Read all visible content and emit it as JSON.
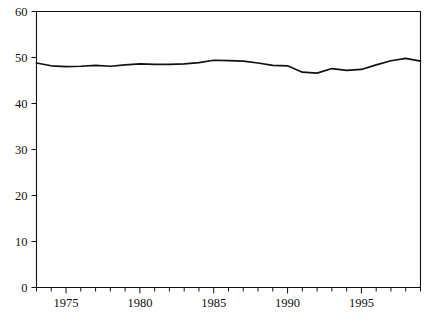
{
  "chart_data": {
    "type": "line",
    "title": "",
    "subtitle": "",
    "xlabel": "",
    "ylabel": "",
    "xlim": [
      1973,
      1999
    ],
    "ylim": [
      0,
      60
    ],
    "grid": false,
    "legend": "none",
    "x_tick_interval": 1,
    "x_label_interval": 5,
    "y_ticks": [
      0,
      10,
      20,
      30,
      40,
      50,
      60
    ],
    "y_tick_labels": [
      "0",
      "10",
      "20",
      "30",
      "40",
      "50",
      "60"
    ],
    "x_ticks": [
      1973,
      1974,
      1975,
      1976,
      1977,
      1978,
      1979,
      1980,
      1981,
      1982,
      1983,
      1984,
      1985,
      1986,
      1987,
      1988,
      1989,
      1990,
      1991,
      1992,
      1993,
      1994,
      1995,
      1996,
      1997,
      1998,
      1999
    ],
    "x_tick_labels": [
      "1975",
      "1980",
      "1985",
      "1990",
      "1995"
    ],
    "x_labelled_ticks": [
      1975,
      1980,
      1985,
      1990,
      1995
    ],
    "series": [
      {
        "name": "series-1",
        "color": "#111111",
        "x": [
          1973,
          1974,
          1975,
          1976,
          1977,
          1978,
          1979,
          1980,
          1981,
          1982,
          1983,
          1984,
          1985,
          1986,
          1987,
          1988,
          1989,
          1990,
          1991,
          1992,
          1993,
          1994,
          1995,
          1996,
          1997,
          1998,
          1999
        ],
        "values": [
          48.8,
          48.2,
          48.0,
          48.1,
          48.3,
          48.1,
          48.4,
          48.6,
          48.5,
          48.5,
          48.6,
          48.9,
          49.4,
          49.3,
          49.2,
          48.8,
          48.3,
          48.2,
          46.8,
          46.6,
          47.6,
          47.2,
          47.4,
          48.4,
          49.3,
          49.8,
          49.2
        ]
      }
    ]
  }
}
